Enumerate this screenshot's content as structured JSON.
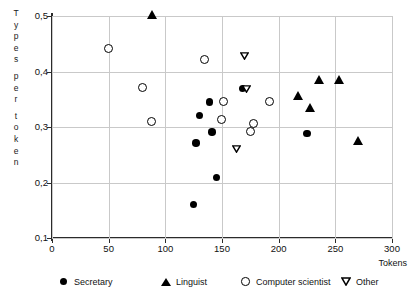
{
  "chart_data": {
    "type": "scatter",
    "title": "",
    "xlabel": "Tokens",
    "ylabel": "Types per token",
    "xlim": [
      0,
      300
    ],
    "ylim": [
      0.1,
      0.5
    ],
    "xticks": [
      "0",
      "50",
      "100",
      "150",
      "200",
      "250",
      "300"
    ],
    "yticks": [
      "0,1",
      "0,2",
      "0,3",
      "0,4",
      "0,5"
    ],
    "grid": true,
    "legend_position": "bottom",
    "series": [
      {
        "name": "Secretary",
        "marker": "filled-circle",
        "color": "#000000",
        "points": [
          {
            "x": 125,
            "y": 0.16
          },
          {
            "x": 127,
            "y": 0.271
          },
          {
            "x": 130,
            "y": 0.321
          },
          {
            "x": 139,
            "y": 0.345
          },
          {
            "x": 141,
            "y": 0.291
          },
          {
            "x": 145,
            "y": 0.209
          },
          {
            "x": 168,
            "y": 0.369
          },
          {
            "x": 225,
            "y": 0.288
          }
        ]
      },
      {
        "name": "Linguist",
        "marker": "filled-triangle-up",
        "color": "#000000",
        "points": [
          {
            "x": 88,
            "y": 0.501
          },
          {
            "x": 217,
            "y": 0.355
          },
          {
            "x": 228,
            "y": 0.334
          },
          {
            "x": 236,
            "y": 0.385
          },
          {
            "x": 253,
            "y": 0.385
          },
          {
            "x": 270,
            "y": 0.274
          }
        ]
      },
      {
        "name": "Computer scientist",
        "marker": "open-circle",
        "color": "#000000",
        "points": [
          {
            "x": 50,
            "y": 0.441
          },
          {
            "x": 80,
            "y": 0.37
          },
          {
            "x": 88,
            "y": 0.308
          },
          {
            "x": 135,
            "y": 0.42
          },
          {
            "x": 152,
            "y": 0.344
          },
          {
            "x": 150,
            "y": 0.312
          },
          {
            "x": 176,
            "y": 0.29
          },
          {
            "x": 178,
            "y": 0.305
          },
          {
            "x": 192,
            "y": 0.345
          }
        ]
      },
      {
        "name": "Other",
        "marker": "open-triangle-down",
        "color": "#000000",
        "points": [
          {
            "x": 170,
            "y": 0.428
          },
          {
            "x": 172,
            "y": 0.369
          },
          {
            "x": 163,
            "y": 0.261
          }
        ]
      }
    ]
  },
  "axes": {
    "y_caption_letters": [
      "T",
      "y",
      "p",
      "e",
      "s",
      "",
      "p",
      "e",
      "r",
      "",
      "t",
      "o",
      "k",
      "e",
      "n"
    ],
    "x_caption": "Tokens"
  },
  "legend": {
    "items": [
      {
        "label": "Secretary",
        "marker": "filled-circle"
      },
      {
        "label": "Linguist",
        "marker": "filled-triangle-up"
      },
      {
        "label": "Computer scientist",
        "marker": "open-circle"
      },
      {
        "label": "Other",
        "marker": "open-triangle-down"
      }
    ]
  }
}
